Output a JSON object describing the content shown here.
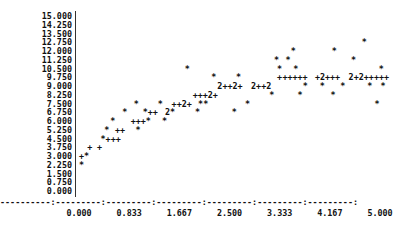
{
  "chart_data": {
    "type": "scatter",
    "title": "",
    "xlabel": "",
    "ylabel": "",
    "xlim": [
      0,
      5
    ],
    "ylim": [
      0,
      15
    ],
    "grid": false,
    "legend": null,
    "y_ticks": [
      "15.000",
      "14.250",
      "13.500",
      "12.750",
      "12.000",
      "11.250",
      "10.500",
      "9.750",
      "9.000",
      "8.250",
      "7.500",
      "6.750",
      "6.000",
      "5.250",
      "4.500",
      "3.750",
      "3.000",
      "2.250",
      "1.500",
      "0.750",
      "0.000"
    ],
    "x_ticks": [
      "0.000",
      "0.833",
      "1.667",
      "2.500",
      "3.333",
      "4.167",
      "5.000"
    ],
    "x_axis_line": "----------:---------:---------:---------:---------:---------:---------:",
    "markers": {
      "*": "observed",
      "+": "predicted",
      "2": "two points overlap"
    },
    "rows": [
      {
        "y": "12.750",
        "cells": [
          {
            "x": 4.74,
            "text": "*"
          }
        ]
      },
      {
        "y": "12.000",
        "cells": [
          {
            "x": 3.56,
            "text": "*"
          },
          {
            "x": 4.24,
            "text": "*"
          }
        ]
      },
      {
        "y": "11.250",
        "cells": [
          {
            "x": 3.47,
            "text": "*"
          },
          {
            "x": 3.28,
            "text": "*"
          },
          {
            "x": 4.56,
            "text": "*"
          }
        ]
      },
      {
        "y": "10.500",
        "cells": [
          {
            "x": 1.8,
            "text": "*"
          },
          {
            "x": 3.33,
            "text": "*"
          },
          {
            "x": 3.6,
            "text": "*"
          },
          {
            "x": 5.02,
            "text": "*"
          }
        ]
      },
      {
        "y": "9.750",
        "cells": [
          {
            "x": 2.24,
            "text": "*"
          },
          {
            "x": 2.65,
            "text": "*"
          },
          {
            "x": 3.33,
            "text": "+"
          },
          {
            "x": 3.42,
            "text": "+++++"
          },
          {
            "x": 3.96,
            "text": "+2+++"
          },
          {
            "x": 4.52,
            "text": "2+2++"
          },
          {
            "x": 4.94,
            "text": "+++"
          }
        ]
      },
      {
        "y": "9.000",
        "cells": [
          {
            "x": 2.34,
            "text": "2++2+"
          },
          {
            "x": 2.9,
            "text": "2++2"
          },
          {
            "x": 3.76,
            "text": "*"
          },
          {
            "x": 4.04,
            "text": "*"
          },
          {
            "x": 4.38,
            "text": "*"
          },
          {
            "x": 4.83,
            "text": "*"
          },
          {
            "x": 5.05,
            "text": "*"
          }
        ]
      },
      {
        "y": "8.250",
        "cells": [
          {
            "x": 1.93,
            "text": "+++2+"
          },
          {
            "x": 3.2,
            "text": "*"
          },
          {
            "x": 3.67,
            "text": "*"
          },
          {
            "x": 4.22,
            "text": "*"
          }
        ]
      },
      {
        "y": "7.500",
        "cells": [
          {
            "x": 0.95,
            "text": "*"
          },
          {
            "x": 1.35,
            "text": "*"
          },
          {
            "x": 1.58,
            "text": "++2+"
          },
          {
            "x": 2.02,
            "text": "**"
          },
          {
            "x": 2.8,
            "text": "*"
          },
          {
            "x": 4.95,
            "text": "*"
          }
        ]
      },
      {
        "y": "6.750",
        "cells": [
          {
            "x": 0.76,
            "text": "*"
          },
          {
            "x": 1.1,
            "text": "*++"
          },
          {
            "x": 1.47,
            "text": "2*"
          },
          {
            "x": 1.97,
            "text": "*"
          },
          {
            "x": 2.58,
            "text": "*"
          }
        ]
      },
      {
        "y": "6.000",
        "cells": [
          {
            "x": 0.56,
            "text": "*"
          },
          {
            "x": 0.9,
            "text": "+++*"
          },
          {
            "x": 1.42,
            "text": "*"
          }
        ]
      },
      {
        "y": "5.250",
        "cells": [
          {
            "x": 0.46,
            "text": "*"
          },
          {
            "x": 0.64,
            "text": "++"
          },
          {
            "x": 0.98,
            "text": "*"
          }
        ]
      },
      {
        "y": "4.500",
        "cells": [
          {
            "x": 0.4,
            "text": "*+++"
          }
        ]
      },
      {
        "y": "3.750",
        "cells": [
          {
            "x": 0.18,
            "text": "+"
          },
          {
            "x": 0.34,
            "text": "+"
          }
        ]
      },
      {
        "y": "3.000",
        "cells": [
          {
            "x": 0.04,
            "text": "+*"
          }
        ]
      },
      {
        "y": "2.250",
        "cells": [
          {
            "x": 0.04,
            "text": "*"
          }
        ]
      }
    ]
  }
}
